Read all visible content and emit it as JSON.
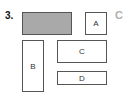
{
  "question": {
    "number": "3.",
    "answer_option": "C"
  },
  "shapes": [
    {
      "id": "shaded",
      "label": "",
      "fill": "#a9a9a9"
    },
    {
      "id": "A",
      "label": "A",
      "fill": "#ffffff"
    },
    {
      "id": "B",
      "label": "B",
      "fill": "#ffffff"
    },
    {
      "id": "C",
      "label": "C",
      "fill": "#ffffff"
    },
    {
      "id": "D",
      "label": "D",
      "fill": "#ffffff"
    }
  ]
}
